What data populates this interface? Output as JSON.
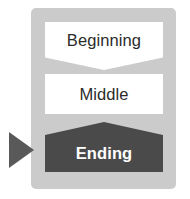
{
  "diagram": {
    "panel": {
      "background_color": "#cbcbcb"
    },
    "pointer": {
      "icon": "triangle-right-icon",
      "color": "#595959",
      "points_to": "Ending"
    },
    "steps": [
      {
        "label": "Beginning",
        "shape": "chevron-down-banner",
        "fill_color": "#ffffff",
        "text_color": "#2b2b2b",
        "selected": false
      },
      {
        "label": "Middle",
        "shape": "rectangle",
        "fill_color": "#ffffff",
        "text_color": "#2b2b2b",
        "selected": false
      },
      {
        "label": "Ending",
        "shape": "peaked-banner",
        "fill_color": "#4a4a4a",
        "text_color": "#ffffff",
        "selected": true
      }
    ]
  }
}
